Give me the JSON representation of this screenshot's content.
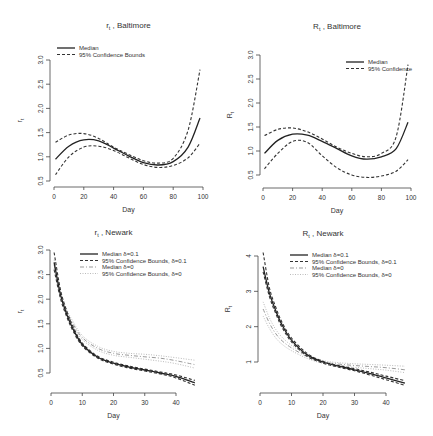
{
  "chart_data": [
    {
      "type": "line",
      "title": "r_t , Baltimore",
      "title_main": "r",
      "title_sub": "t",
      "title_rest": " , Baltimore",
      "xlabel": "Day",
      "ylabel": "r_t",
      "xlim": [
        0,
        100
      ],
      "ylim": [
        0.5,
        3.0
      ],
      "xticks": [
        0,
        20,
        40,
        60,
        80,
        100
      ],
      "yticks": [
        "0.5",
        "1.0",
        "1.5",
        "2.0",
        "2.5",
        "3.0"
      ],
      "legend_position": "top-left",
      "legend": [
        "Median",
        "95% Confidence Bounds"
      ],
      "x": [
        1,
        10,
        20,
        30,
        40,
        50,
        60,
        70,
        80,
        90,
        98
      ],
      "series": [
        {
          "name": "Median",
          "style": "solid",
          "values": [
            0.95,
            1.22,
            1.35,
            1.33,
            1.18,
            1.02,
            0.88,
            0.83,
            0.9,
            1.2,
            1.8
          ]
        },
        {
          "name": "95% Confidence Bounds (upper)",
          "style": "dashed",
          "values": [
            1.3,
            1.45,
            1.48,
            1.38,
            1.2,
            1.05,
            0.92,
            0.87,
            0.97,
            1.55,
            2.8
          ]
        },
        {
          "name": "95% Confidence Bounds (lower)",
          "style": "dashed",
          "values": [
            0.63,
            1.0,
            1.2,
            1.22,
            1.13,
            0.98,
            0.84,
            0.78,
            0.82,
            0.98,
            1.28
          ]
        }
      ]
    },
    {
      "type": "line",
      "title": "R_t , Baltimore",
      "title_main": "R",
      "title_sub": "t",
      "title_rest": " , Baltimore",
      "xlabel": "Day",
      "ylabel": "R_t",
      "xlim": [
        0,
        100
      ],
      "ylim": [
        0.5,
        3.0
      ],
      "xticks": [
        0,
        20,
        40,
        60,
        80,
        100
      ],
      "yticks": [
        "0.5",
        "1.0",
        "1.5",
        "2.0",
        "2.5",
        "3.0"
      ],
      "legend_position": "top-right",
      "legend": [
        "Median",
        "95% Confidence"
      ],
      "x": [
        1,
        10,
        20,
        30,
        40,
        50,
        60,
        70,
        80,
        90,
        98
      ],
      "series": [
        {
          "name": "Median",
          "style": "solid",
          "values": [
            0.95,
            1.22,
            1.35,
            1.33,
            1.2,
            1.05,
            0.9,
            0.83,
            0.88,
            1.05,
            1.6
          ]
        },
        {
          "name": "95% Confidence Bounds (upper)",
          "style": "dashed",
          "values": [
            1.32,
            1.45,
            1.48,
            1.4,
            1.25,
            1.08,
            0.95,
            0.88,
            0.95,
            1.3,
            2.8
          ]
        },
        {
          "name": "95% Confidence Bounds (lower)",
          "style": "dashed",
          "values": [
            0.63,
            0.95,
            1.2,
            1.18,
            0.9,
            0.65,
            0.5,
            0.45,
            0.48,
            0.58,
            0.82
          ]
        }
      ]
    },
    {
      "type": "line",
      "title": "r_t , Newark",
      "title_main": "r",
      "title_sub": "t",
      "title_rest": " , Newark",
      "xlabel": "Day",
      "ylabel": "r_t",
      "xlim": [
        0,
        40
      ],
      "ylim": [
        0.5,
        3.0
      ],
      "xticks": [
        0,
        10,
        20,
        30,
        40
      ],
      "yticks": [
        "0.5",
        "1.0",
        "1.5",
        "2.0",
        "2.5",
        "3.0"
      ],
      "legend_position": "top-right",
      "legend": [
        "Median δ=0.1",
        "95% Confidence Bounds, δ=0.1",
        "Median δ=0",
        "95% Confidence Bounds, δ=0"
      ],
      "x": [
        1,
        3,
        5,
        7,
        10,
        15,
        20,
        25,
        30,
        35,
        40,
        46
      ],
      "series": [
        {
          "name": "Median δ=0.1",
          "style": "solid",
          "values": [
            2.75,
            2.1,
            1.7,
            1.4,
            1.08,
            0.82,
            0.7,
            0.62,
            0.56,
            0.5,
            0.43,
            0.3
          ]
        },
        {
          "name": "95% Confidence Bounds, δ=0.1 (upper)",
          "style": "dashed",
          "values": [
            2.95,
            2.2,
            1.77,
            1.45,
            1.11,
            0.84,
            0.72,
            0.64,
            0.58,
            0.52,
            0.46,
            0.35
          ]
        },
        {
          "name": "95% Confidence Bounds, δ=0.1 (lower)",
          "style": "dashed",
          "values": [
            2.6,
            2.02,
            1.65,
            1.36,
            1.05,
            0.8,
            0.68,
            0.6,
            0.54,
            0.48,
            0.4,
            0.25
          ]
        },
        {
          "name": "Median δ=0",
          "style": "dashdot",
          "values": [
            2.7,
            2.12,
            1.75,
            1.5,
            1.22,
            1.0,
            0.9,
            0.86,
            0.83,
            0.8,
            0.75,
            0.67
          ]
        },
        {
          "name": "95% Confidence Bounds, δ=0 (upper)",
          "style": "dotted",
          "values": [
            2.8,
            2.18,
            1.8,
            1.55,
            1.26,
            1.04,
            0.94,
            0.9,
            0.88,
            0.85,
            0.81,
            0.76
          ]
        },
        {
          "name": "95% Confidence Bounds, δ=0 (lower)",
          "style": "dotted",
          "values": [
            2.62,
            2.06,
            1.7,
            1.46,
            1.18,
            0.96,
            0.86,
            0.82,
            0.78,
            0.74,
            0.69,
            0.6
          ]
        }
      ]
    },
    {
      "type": "line",
      "title": "R_t , Newark",
      "title_main": "R",
      "title_sub": "t",
      "title_rest": " , Newark",
      "xlabel": "Day",
      "ylabel": "R_t",
      "xlim": [
        0,
        40
      ],
      "ylim": [
        1,
        4
      ],
      "xticks": [
        0,
        10,
        20,
        30,
        40
      ],
      "yticks": [
        "1",
        "2",
        "3",
        "4"
      ],
      "legend_position": "top-right",
      "legend": [
        "Median δ=0.1",
        "95% Confidence Bounds, δ=0.1",
        "Median δ=0",
        "95% Confidence Bounds, δ=0"
      ],
      "x": [
        1,
        3,
        5,
        7,
        10,
        15,
        20,
        25,
        30,
        35,
        40,
        46
      ],
      "series": [
        {
          "name": "Median δ=0.1",
          "style": "solid",
          "values": [
            3.7,
            2.95,
            2.45,
            2.05,
            1.62,
            1.2,
            1.0,
            0.88,
            0.78,
            0.67,
            0.55,
            0.4
          ]
        },
        {
          "name": "95% Confidence Bounds, δ=0.1 (upper)",
          "style": "dashed",
          "values": [
            4.1,
            3.1,
            2.55,
            2.12,
            1.68,
            1.24,
            1.02,
            0.9,
            0.81,
            0.71,
            0.6,
            0.47
          ]
        },
        {
          "name": "95% Confidence Bounds, δ=0.1 (lower)",
          "style": "dashed",
          "values": [
            3.55,
            2.85,
            2.37,
            1.98,
            1.57,
            1.16,
            0.97,
            0.85,
            0.75,
            0.63,
            0.5,
            0.34
          ]
        },
        {
          "name": "Median δ=0",
          "style": "dashdot",
          "values": [
            2.5,
            2.1,
            1.8,
            1.6,
            1.4,
            1.15,
            1.0,
            0.94,
            0.9,
            0.87,
            0.84,
            0.78
          ]
        },
        {
          "name": "95% Confidence Bounds, δ=0 (upper)",
          "style": "dotted",
          "values": [
            2.7,
            2.25,
            1.92,
            1.7,
            1.47,
            1.2,
            1.04,
            0.98,
            0.95,
            0.93,
            0.91,
            0.88
          ]
        },
        {
          "name": "95% Confidence Bounds, δ=0 (lower)",
          "style": "dotted",
          "values": [
            2.3,
            1.95,
            1.68,
            1.5,
            1.32,
            1.1,
            0.96,
            0.9,
            0.85,
            0.81,
            0.77,
            0.7
          ]
        }
      ]
    }
  ]
}
